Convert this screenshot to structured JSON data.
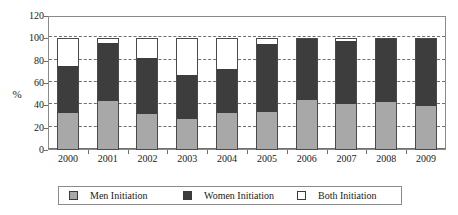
{
  "chart_data": {
    "type": "bar",
    "stacked": true,
    "title": "",
    "xlabel": "",
    "ylabel": "%",
    "ylim": [
      0,
      120
    ],
    "yticks": [
      0,
      20,
      40,
      60,
      80,
      100,
      120
    ],
    "grid": true,
    "legend_position": "bottom",
    "categories": [
      "2000",
      "2001",
      "2002",
      "2003",
      "2004",
      "2005",
      "2006",
      "2007",
      "2008",
      "2009"
    ],
    "series": [
      {
        "name": "Men Initiation",
        "color": "#a8a8a8",
        "values": [
          33,
          44,
          32,
          28,
          33,
          34,
          45,
          41,
          43,
          39
        ]
      },
      {
        "name": "Women Initiation",
        "color": "#3d3d3d",
        "values": [
          42,
          52,
          50,
          39,
          40,
          61,
          55,
          57,
          57,
          61
        ]
      },
      {
        "name": "Both Initiation",
        "color": "#ffffff",
        "values": [
          25,
          4,
          18,
          33,
          27,
          5,
          0,
          2,
          0,
          0
        ]
      }
    ],
    "cumulative_tops": {
      "men": [
        33,
        44,
        32,
        28,
        33,
        34,
        45,
        41,
        43,
        39
      ],
      "women": [
        75,
        96,
        82,
        67,
        73,
        95,
        100,
        98,
        100,
        100
      ],
      "both": [
        100,
        100,
        100,
        100,
        100,
        100,
        100,
        100,
        100,
        100
      ]
    }
  },
  "axis": {
    "y_title": "%",
    "y_ticks": [
      "120",
      "100",
      "80",
      "60",
      "40",
      "20",
      "0"
    ],
    "x_ticks": [
      "2000",
      "2001",
      "2002",
      "2003",
      "2004",
      "2005",
      "2006",
      "2007",
      "2008",
      "2009"
    ]
  },
  "legend": {
    "items": [
      {
        "label": "Men Initiation",
        "color": "#a8a8a8"
      },
      {
        "label": "Women Initiation",
        "color": "#3d3d3d"
      },
      {
        "label": "Both Initiation",
        "color": "#ffffff"
      }
    ]
  }
}
